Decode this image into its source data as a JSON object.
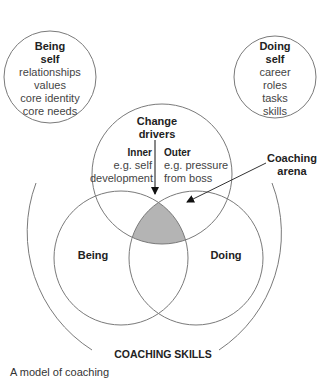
{
  "being_self": {
    "title_line1": "Being",
    "title_line2": "self",
    "items": [
      "relationships",
      "values",
      "core identity",
      "core needs"
    ]
  },
  "doing_self": {
    "title_line1": "Doing",
    "title_line2": "self",
    "items": [
      "career",
      "roles",
      "tasks",
      "skills"
    ]
  },
  "change_drivers": {
    "title_line1": "Change",
    "title_line2": "drivers",
    "inner": {
      "label": "Inner",
      "line1": "e.g. self",
      "line2": "development"
    },
    "outer": {
      "label": "Outer",
      "line1": "e.g. pressure",
      "line2": "from boss"
    }
  },
  "coaching_arena": {
    "line1": "Coaching",
    "line2": "arena"
  },
  "being_label": "Being",
  "doing_label": "Doing",
  "coaching_skills_label": "COACHING SKILLS",
  "caption": "A model of coaching",
  "colors": {
    "stroke": "#8a8a8a",
    "arena_fill": "#b4b4b4",
    "text": "#222222"
  }
}
